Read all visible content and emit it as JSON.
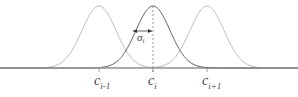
{
  "diagram": {
    "centers": [
      {
        "name": "c",
        "sub": "i-1",
        "x": 99
      },
      {
        "name": "c",
        "sub": "i",
        "x": 153
      },
      {
        "name": "c",
        "sub": "i+1",
        "x": 207
      }
    ],
    "width_label": {
      "name": "σ",
      "sub": "i"
    },
    "colors": {
      "axis": "#7a7a7a",
      "center_curve": "#555555",
      "side_curve": "#b5b5b5",
      "dashed": "#777777",
      "text": "#444444"
    }
  }
}
